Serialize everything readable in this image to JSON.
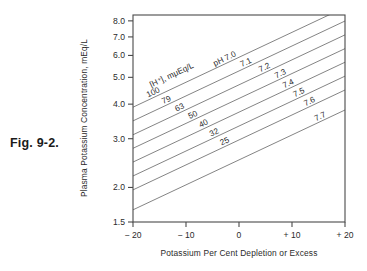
{
  "figure": {
    "caption": "Fig. 9-2."
  },
  "chart_data": {
    "type": "line",
    "title": "",
    "xlabel": "Potassium Per Cent Depletion or Excess",
    "ylabel": "Plasma Potassium Concentration, mEq/L",
    "xlim": [
      -20,
      20
    ],
    "ylim": [
      1.5,
      8.4
    ],
    "yscale": "log",
    "xscale": "linear",
    "grid": false,
    "legend_position": "inline-labels",
    "xticks": [
      -20,
      -10,
      0,
      10,
      20
    ],
    "xticklabels": [
      "− 20",
      "− 10",
      "0",
      "+ 10",
      "+ 20"
    ],
    "yticks": [
      1.5,
      2.0,
      3.0,
      4.0,
      5.0,
      6.0,
      7.0,
      8.0
    ],
    "yticklabels": [
      "1.5",
      "2.0",
      "3.0",
      "4.0",
      "5.0",
      "6.0",
      "7.0",
      "8.0"
    ],
    "series_header": "[H⁺], mμEq/L",
    "ph_prefix": "pH",
    "series": [
      {
        "name": "pH 7.0",
        "ph_label": "pH 7.0",
        "h_label": "100",
        "ph": 7.0,
        "h_conc": 100,
        "x": [
          -20,
          20
        ],
        "values": [
          3.9,
          8.95
        ]
      },
      {
        "name": "pH 7.1",
        "ph_label": "7.1",
        "h_label": "79",
        "ph": 7.1,
        "h_conc": 79,
        "x": [
          -20,
          20
        ],
        "values": [
          3.48,
          7.99
        ]
      },
      {
        "name": "pH 7.2",
        "ph_label": "7.2",
        "h_label": "63",
        "ph": 7.2,
        "h_conc": 63,
        "x": [
          -20,
          20
        ],
        "values": [
          3.1,
          7.12
        ]
      },
      {
        "name": "pH 7.3",
        "ph_label": "7.3",
        "h_label": "50",
        "ph": 7.3,
        "h_conc": 50,
        "x": [
          -20,
          20
        ],
        "values": [
          2.77,
          6.35
        ]
      },
      {
        "name": "pH 7.4",
        "ph_label": "7.4",
        "h_label": "40",
        "ph": 7.4,
        "h_conc": 40,
        "x": [
          -20,
          20
        ],
        "values": [
          2.47,
          5.67
        ]
      },
      {
        "name": "pH 7.5",
        "ph_label": "7.5",
        "h_label": "32",
        "ph": 7.5,
        "h_conc": 32,
        "x": [
          -20,
          20
        ],
        "values": [
          2.2,
          5.05
        ]
      },
      {
        "name": "pH 7.6",
        "ph_label": "7.6",
        "h_label": "25",
        "ph": 7.6,
        "h_conc": 25,
        "x": [
          -20,
          20
        ],
        "values": [
          1.96,
          4.5
        ]
      },
      {
        "name": "pH 7.7",
        "ph_label": "7.7",
        "h_label": "",
        "ph": 7.7,
        "h_conc": null,
        "x": [
          -20,
          20
        ],
        "values": [
          1.66,
          3.81
        ]
      }
    ]
  },
  "colors": {
    "background": "#ffffff",
    "frame": "#4a4a4a",
    "line": "#6e6e6e",
    "text": "#2b2b2b"
  }
}
